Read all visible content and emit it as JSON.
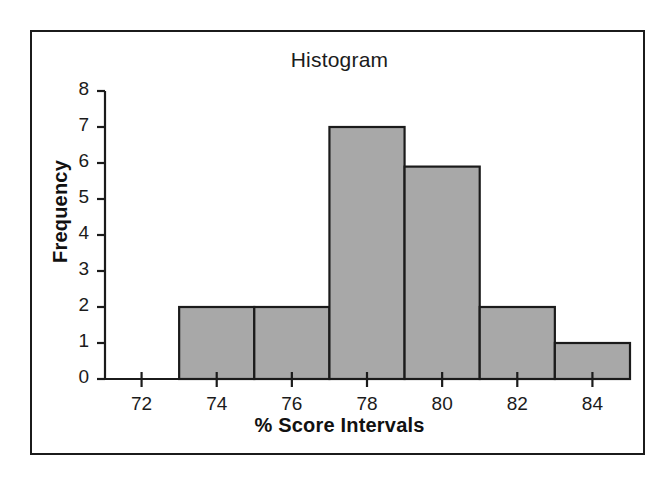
{
  "figure": {
    "background_color": "#ffffff",
    "frame_color": "#1b1b1b"
  },
  "chart_data": {
    "type": "bar",
    "title": "Histogram",
    "xlabel": "% Score Intervals",
    "ylabel": "Frequency",
    "xlim": [
      71,
      85
    ],
    "ylim": [
      0,
      8
    ],
    "grid": false,
    "legend": null,
    "bar_color": "#a8a8a8",
    "bar_edge_color": "#1b1b1b",
    "xticks": [
      72,
      74,
      76,
      78,
      80,
      82,
      84
    ],
    "xtick_labels": [
      "72",
      "74",
      "76",
      "78",
      "80",
      "82",
      "84"
    ],
    "yticks": [
      0,
      1,
      2,
      3,
      4,
      5,
      6,
      7,
      8
    ],
    "ytick_labels": [
      "0",
      "1",
      "2",
      "3",
      "4",
      "5",
      "6",
      "7",
      "8"
    ],
    "bin_edges": [
      73,
      75,
      77,
      79,
      81,
      83,
      85
    ],
    "categories": [
      "73-75",
      "75-77",
      "77-79",
      "79-81",
      "81-83",
      "83-85"
    ],
    "values": [
      2,
      2,
      7,
      5.9,
      2,
      1
    ],
    "bars": [
      {
        "label": "73-75",
        "x0": 73,
        "x1": 75,
        "value": 2
      },
      {
        "label": "75-77",
        "x0": 75,
        "x1": 77,
        "value": 2
      },
      {
        "label": "77-79",
        "x0": 77,
        "x1": 79,
        "value": 7
      },
      {
        "label": "79-81",
        "x0": 79,
        "x1": 81,
        "value": 5.9
      },
      {
        "label": "81-83",
        "x0": 81,
        "x1": 83,
        "value": 2
      },
      {
        "label": "83-85",
        "x0": 83,
        "x1": 85,
        "value": 1
      }
    ]
  }
}
